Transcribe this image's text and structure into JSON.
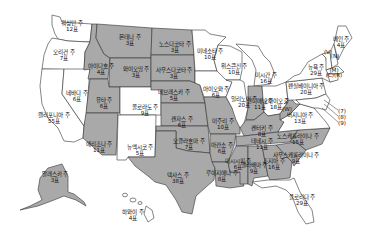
{
  "legend": {
    "republican_fill": "#a9a9a9",
    "democratic_fill": "#ffffff"
  },
  "states": [
    {
      "id": "WA",
      "name": "워싱턴 주",
      "votes": "12표",
      "party": "blue",
      "x": 72,
      "y": 26
    },
    {
      "id": "OR",
      "name": "오리건 주",
      "votes": "7표",
      "party": "blue",
      "x": 64,
      "y": 55
    },
    {
      "id": "CA",
      "name": "캘리포니아 주",
      "votes": "55표",
      "party": "blue",
      "x": 54,
      "y": 118
    },
    {
      "id": "NV",
      "name": "네바다 주",
      "votes": "6표",
      "party": "blue",
      "x": 77,
      "y": 96
    },
    {
      "id": "ID",
      "name": "아이다호 주",
      "votes": "4표",
      "party": "red",
      "x": 101,
      "y": 69
    },
    {
      "id": "MT",
      "name": "몬태나 주",
      "votes": "3표",
      "party": "red",
      "x": 130,
      "y": 40
    },
    {
      "id": "WY",
      "name": "와이오밍 주",
      "votes": "3표",
      "party": "red",
      "x": 136,
      "y": 72
    },
    {
      "id": "UT",
      "name": "유타 주",
      "votes": "6표",
      "party": "red",
      "x": 104,
      "y": 103
    },
    {
      "id": "AZ",
      "name": "애리조나 주",
      "votes": "11표",
      "party": "red",
      "x": 99,
      "y": 147
    },
    {
      "id": "CO",
      "name": "콜로라도 주",
      "votes": "9표",
      "party": "blue",
      "x": 145,
      "y": 110
    },
    {
      "id": "NM",
      "name": "뉴멕시코 주",
      "votes": "5표",
      "party": "blue",
      "x": 140,
      "y": 150
    },
    {
      "id": "ND",
      "name": "노스다코타 주",
      "votes": "3표",
      "party": "red",
      "x": 175,
      "y": 47
    },
    {
      "id": "SD",
      "name": "사우스다코타 주",
      "votes": "3표",
      "party": "red",
      "x": 174,
      "y": 73
    },
    {
      "id": "NE",
      "name": "네브래스카 주",
      "votes": "5표",
      "party": "red",
      "x": 174,
      "y": 95
    },
    {
      "id": "KS",
      "name": "캔자스 주",
      "votes": "6표",
      "party": "red",
      "x": 182,
      "y": 122
    },
    {
      "id": "OK",
      "name": "오클라호마 주",
      "votes": "7표",
      "party": "red",
      "x": 189,
      "y": 144
    },
    {
      "id": "TX",
      "name": "텍사스 주",
      "votes": "38표",
      "party": "red",
      "x": 178,
      "y": 178
    },
    {
      "id": "MN",
      "name": "미네소타 주",
      "votes": "10표",
      "party": "blue",
      "x": 210,
      "y": 54
    },
    {
      "id": "IA",
      "name": "아이오와 주",
      "votes": "6표",
      "party": "blue",
      "x": 216,
      "y": 92
    },
    {
      "id": "MO",
      "name": "미주리 주",
      "votes": "10표",
      "party": "red",
      "x": 223,
      "y": 124
    },
    {
      "id": "AR",
      "name": "아칸소 주",
      "votes": "6표",
      "party": "red",
      "x": 222,
      "y": 148
    },
    {
      "id": "LA",
      "name": "루이지애나 주",
      "votes": "8표",
      "party": "red",
      "x": 222,
      "y": 176
    },
    {
      "id": "WI",
      "name": "위스콘신 주",
      "votes": "10표",
      "party": "blue",
      "x": 234,
      "y": 69
    },
    {
      "id": "IL",
      "name": "일리노이 주",
      "votes": "20표",
      "party": "blue",
      "x": 244,
      "y": 102
    },
    {
      "id": "MI",
      "name": "미시간 주",
      "votes": "16표",
      "party": "blue",
      "x": 266,
      "y": 78
    },
    {
      "id": "IN",
      "name": "인디애나 주",
      "votes": "11표",
      "party": "red",
      "x": 260,
      "y": 104
    },
    {
      "id": "OH",
      "name": "오하이오 주",
      "votes": "18표",
      "party": "blue",
      "x": 276,
      "y": 104
    },
    {
      "id": "KY",
      "name": "켄터키 주",
      "votes": "8표",
      "party": "red",
      "x": 262,
      "y": 131
    },
    {
      "id": "TN",
      "name": "테네시 주",
      "votes": "11표",
      "party": "red",
      "x": 262,
      "y": 144
    },
    {
      "id": "MS",
      "name": "미시시피 주",
      "votes": "6표",
      "party": "red",
      "x": 238,
      "y": 164
    },
    {
      "id": "AL",
      "name": "앨라배마 주",
      "votes": "9표",
      "party": "red",
      "x": 254,
      "y": 168
    },
    {
      "id": "GA",
      "name": "조지아 주",
      "votes": "16표",
      "party": "red",
      "x": 274,
      "y": 164
    },
    {
      "id": "FL",
      "name": "플로리다 주",
      "votes": "29표",
      "party": "blue",
      "x": 302,
      "y": 200
    },
    {
      "id": "SC",
      "name": "사우스캐롤라이나 주",
      "votes": "9표",
      "party": "red",
      "x": 296,
      "y": 158
    },
    {
      "id": "NC",
      "name": "노스캐롤라이나 주",
      "votes": "15표",
      "party": "red",
      "x": 298,
      "y": 139
    },
    {
      "id": "VA",
      "name": "버지니아 주",
      "votes": "13표",
      "party": "blue",
      "x": 300,
      "y": 118
    },
    {
      "id": "WV",
      "name": "(W)",
      "votes": "",
      "party": "red",
      "x": 287,
      "y": 112
    },
    {
      "id": "PA",
      "name": "펜실베이니아 주",
      "votes": "20표",
      "party": "blue",
      "x": 306,
      "y": 89
    },
    {
      "id": "NY",
      "name": "뉴욕 주",
      "votes": "29표",
      "party": "blue",
      "x": 316,
      "y": 70
    },
    {
      "id": "ME",
      "name": "메인 주",
      "votes": "4표",
      "party": "blue",
      "x": 341,
      "y": 42
    },
    {
      "id": "VT",
      "name": "(V)",
      "votes": "",
      "party": "blue",
      "x": 328,
      "y": 55
    },
    {
      "id": "NH",
      "name": "(N)",
      "votes": "",
      "party": "blue",
      "x": 335,
      "y": 59
    },
    {
      "id": "MA",
      "name": "(M)",
      "votes": "",
      "party": "blue",
      "x": 334,
      "y": 73
    },
    {
      "id": "CT_RI",
      "name": "(C)(R)",
      "votes": "",
      "party": "blue",
      "x": 334,
      "y": 78
    },
    {
      "id": "AK",
      "name": "알래스카 주",
      "votes": "3표",
      "party": "red",
      "x": 55,
      "y": 177
    },
    {
      "id": "HI",
      "name": "하와이 주",
      "votes": "4표",
      "party": "blue",
      "x": 133,
      "y": 215
    }
  ],
  "callouts": [
    {
      "label": "(7)",
      "x": 342,
      "y": 111
    },
    {
      "label": "(8)",
      "x": 342,
      "y": 117
    },
    {
      "label": "(9)",
      "x": 342,
      "y": 123
    }
  ]
}
